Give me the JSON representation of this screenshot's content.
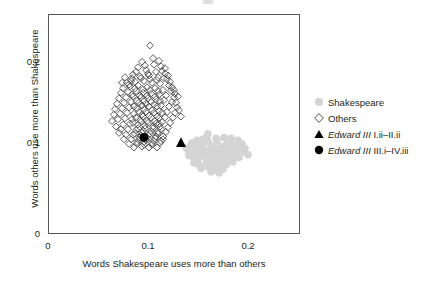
{
  "figure": {
    "background": "#ffffff",
    "frame_color": "#58585a",
    "text_color": "#231f20"
  },
  "axes": {
    "x": {
      "label": "Words Shakespeare uses more than others",
      "ticks": [
        "0",
        "0.1",
        "0.2"
      ],
      "tick_values": [
        0,
        0.1,
        0.2
      ],
      "range": [
        0,
        0.252
      ]
    },
    "y": {
      "label": "Words others use more than Shakespeare",
      "ticks": [
        "0",
        "0.1",
        "0.2"
      ],
      "tick_values": [
        0,
        0.1,
        0.2
      ],
      "range": [
        0,
        0.2415
      ]
    }
  },
  "legend": {
    "position": "right",
    "items": [
      {
        "marker": "circle-filled",
        "color": "#d4d4d4",
        "label": "Shakespeare",
        "italic_prefix": ""
      },
      {
        "marker": "diamond-open",
        "color": "#4d4d4f",
        "label": "Others",
        "italic_prefix": ""
      },
      {
        "marker": "triangle-filled",
        "color": "#000000",
        "label": " I.ii–II.ii",
        "italic_prefix": "Edward III"
      },
      {
        "marker": "circle-filled",
        "color": "#000000",
        "label": " III.i–IV.iii",
        "italic_prefix": "Edward III"
      }
    ]
  },
  "chart_data": {
    "type": "scatter",
    "title": "",
    "xlabel": "Words Shakespeare uses more than others",
    "ylabel": "Words others use more than Shakespeare",
    "xlim": [
      0,
      0.252
    ],
    "ylim": [
      0,
      0.2415
    ],
    "grid": false,
    "legend_position": "right",
    "series": [
      {
        "name": "Shakespeare",
        "marker": "circle-filled",
        "color": "#d4d4d4",
        "size": 7.5,
        "points": [
          [
            0.153,
            0.09
          ],
          [
            0.158,
            0.086
          ],
          [
            0.162,
            0.092
          ],
          [
            0.15,
            0.083
          ],
          [
            0.166,
            0.088
          ],
          [
            0.171,
            0.091
          ],
          [
            0.146,
            0.088
          ],
          [
            0.175,
            0.085
          ],
          [
            0.159,
            0.079
          ],
          [
            0.168,
            0.081
          ],
          [
            0.154,
            0.095
          ],
          [
            0.163,
            0.097
          ],
          [
            0.177,
            0.093
          ],
          [
            0.148,
            0.094
          ],
          [
            0.181,
            0.089
          ],
          [
            0.157,
            0.075
          ],
          [
            0.165,
            0.077
          ],
          [
            0.172,
            0.078
          ],
          [
            0.143,
            0.098
          ],
          [
            0.184,
            0.096
          ],
          [
            0.16,
            0.101
          ],
          [
            0.152,
            0.1
          ],
          [
            0.169,
            0.102
          ],
          [
            0.179,
            0.099
          ],
          [
            0.186,
            0.092
          ],
          [
            0.14,
            0.092
          ],
          [
            0.155,
            0.087
          ],
          [
            0.164,
            0.084
          ],
          [
            0.173,
            0.087
          ],
          [
            0.147,
            0.081
          ],
          [
            0.182,
            0.082
          ],
          [
            0.161,
            0.073
          ],
          [
            0.17,
            0.074
          ],
          [
            0.151,
            0.076
          ],
          [
            0.178,
            0.076
          ],
          [
            0.145,
            0.085
          ],
          [
            0.188,
            0.086
          ],
          [
            0.156,
            0.092
          ],
          [
            0.167,
            0.094
          ],
          [
            0.174,
            0.096
          ],
          [
            0.142,
            0.089
          ],
          [
            0.19,
            0.103
          ],
          [
            0.183,
            0.105
          ],
          [
            0.176,
            0.106
          ],
          [
            0.159,
            0.107
          ],
          [
            0.149,
            0.103
          ],
          [
            0.193,
            0.095
          ],
          [
            0.196,
            0.09
          ],
          [
            0.2,
            0.087
          ],
          [
            0.138,
            0.095
          ],
          [
            0.144,
            0.1
          ],
          [
            0.153,
            0.072
          ],
          [
            0.166,
            0.07
          ],
          [
            0.175,
            0.071
          ],
          [
            0.185,
            0.079
          ],
          [
            0.191,
            0.084
          ],
          [
            0.158,
            0.083
          ],
          [
            0.162,
            0.08
          ],
          [
            0.17,
            0.085
          ],
          [
            0.18,
            0.09
          ],
          [
            0.147,
            0.09
          ],
          [
            0.151,
            0.093
          ],
          [
            0.164,
            0.089
          ],
          [
            0.172,
            0.083
          ],
          [
            0.177,
            0.081
          ],
          [
            0.187,
            0.098
          ],
          [
            0.194,
            0.099
          ],
          [
            0.141,
            0.086
          ],
          [
            0.155,
            0.104
          ],
          [
            0.168,
            0.105
          ],
          [
            0.16,
            0.11
          ],
          [
            0.152,
            0.097
          ],
          [
            0.179,
            0.094
          ],
          [
            0.189,
            0.091
          ],
          [
            0.146,
            0.078
          ],
          [
            0.163,
            0.068
          ],
          [
            0.171,
            0.067
          ],
          [
            0.157,
            0.101
          ],
          [
            0.181,
            0.1
          ],
          [
            0.197,
            0.094
          ]
        ]
      },
      {
        "name": "Others",
        "marker": "diamond-open",
        "color": "#4d4d4f",
        "size": 7,
        "points": [
          [
            0.102,
            0.207
          ],
          [
            0.094,
            0.189
          ],
          [
            0.106,
            0.186
          ],
          [
            0.113,
            0.184
          ],
          [
            0.088,
            0.178
          ],
          [
            0.098,
            0.18
          ],
          [
            0.108,
            0.178
          ],
          [
            0.117,
            0.176
          ],
          [
            0.084,
            0.171
          ],
          [
            0.092,
            0.173
          ],
          [
            0.101,
            0.174
          ],
          [
            0.11,
            0.172
          ],
          [
            0.119,
            0.17
          ],
          [
            0.079,
            0.166
          ],
          [
            0.087,
            0.167
          ],
          [
            0.096,
            0.168
          ],
          [
            0.104,
            0.166
          ],
          [
            0.112,
            0.165
          ],
          [
            0.121,
            0.163
          ],
          [
            0.075,
            0.16
          ],
          [
            0.082,
            0.162
          ],
          [
            0.09,
            0.163
          ],
          [
            0.099,
            0.161
          ],
          [
            0.107,
            0.16
          ],
          [
            0.115,
            0.158
          ],
          [
            0.123,
            0.157
          ],
          [
            0.073,
            0.155
          ],
          [
            0.08,
            0.156
          ],
          [
            0.088,
            0.157
          ],
          [
            0.095,
            0.155
          ],
          [
            0.103,
            0.154
          ],
          [
            0.111,
            0.153
          ],
          [
            0.118,
            0.152
          ],
          [
            0.126,
            0.15
          ],
          [
            0.071,
            0.149
          ],
          [
            0.078,
            0.15
          ],
          [
            0.085,
            0.151
          ],
          [
            0.093,
            0.15
          ],
          [
            0.1,
            0.149
          ],
          [
            0.108,
            0.148
          ],
          [
            0.116,
            0.147
          ],
          [
            0.124,
            0.145
          ],
          [
            0.069,
            0.143
          ],
          [
            0.076,
            0.144
          ],
          [
            0.083,
            0.145
          ],
          [
            0.091,
            0.144
          ],
          [
            0.098,
            0.143
          ],
          [
            0.106,
            0.142
          ],
          [
            0.113,
            0.141
          ],
          [
            0.121,
            0.14
          ],
          [
            0.129,
            0.139
          ],
          [
            0.067,
            0.137
          ],
          [
            0.074,
            0.138
          ],
          [
            0.081,
            0.139
          ],
          [
            0.089,
            0.138
          ],
          [
            0.096,
            0.137
          ],
          [
            0.104,
            0.136
          ],
          [
            0.111,
            0.135
          ],
          [
            0.119,
            0.134
          ],
          [
            0.127,
            0.133
          ],
          [
            0.072,
            0.132
          ],
          [
            0.079,
            0.133
          ],
          [
            0.086,
            0.132
          ],
          [
            0.094,
            0.131
          ],
          [
            0.101,
            0.13
          ],
          [
            0.109,
            0.129
          ],
          [
            0.117,
            0.128
          ],
          [
            0.125,
            0.128
          ],
          [
            0.07,
            0.126
          ],
          [
            0.077,
            0.127
          ],
          [
            0.084,
            0.126
          ],
          [
            0.092,
            0.125
          ],
          [
            0.099,
            0.124
          ],
          [
            0.107,
            0.124
          ],
          [
            0.114,
            0.123
          ],
          [
            0.122,
            0.122
          ],
          [
            0.075,
            0.12
          ],
          [
            0.082,
            0.121
          ],
          [
            0.09,
            0.12
          ],
          [
            0.097,
            0.119
          ],
          [
            0.105,
            0.118
          ],
          [
            0.112,
            0.118
          ],
          [
            0.12,
            0.117
          ],
          [
            0.073,
            0.115
          ],
          [
            0.08,
            0.115
          ],
          [
            0.088,
            0.114
          ],
          [
            0.095,
            0.113
          ],
          [
            0.103,
            0.113
          ],
          [
            0.11,
            0.112
          ],
          [
            0.118,
            0.112
          ],
          [
            0.078,
            0.109
          ],
          [
            0.085,
            0.109
          ],
          [
            0.093,
            0.108
          ],
          [
            0.1,
            0.108
          ],
          [
            0.108,
            0.107
          ],
          [
            0.115,
            0.107
          ],
          [
            0.076,
            0.104
          ],
          [
            0.083,
            0.104
          ],
          [
            0.091,
            0.103
          ],
          [
            0.098,
            0.103
          ],
          [
            0.106,
            0.102
          ],
          [
            0.113,
            0.102
          ],
          [
            0.081,
            0.099
          ],
          [
            0.089,
            0.099
          ],
          [
            0.096,
            0.098
          ],
          [
            0.104,
            0.098
          ],
          [
            0.111,
            0.121
          ],
          [
            0.128,
            0.144
          ],
          [
            0.131,
            0.136
          ],
          [
            0.133,
            0.129
          ],
          [
            0.126,
            0.158
          ],
          [
            0.13,
            0.151
          ],
          [
            0.086,
            0.095
          ],
          [
            0.094,
            0.096
          ],
          [
            0.101,
            0.095
          ],
          [
            0.109,
            0.095
          ],
          [
            0.066,
            0.131
          ],
          [
            0.064,
            0.124
          ],
          [
            0.068,
            0.118
          ],
          [
            0.071,
            0.111
          ],
          [
            0.097,
            0.185
          ],
          [
            0.111,
            0.19
          ],
          [
            0.105,
            0.193
          ],
          [
            0.117,
            0.182
          ],
          [
            0.09,
            0.183
          ],
          [
            0.1,
            0.176
          ],
          [
            0.114,
            0.179
          ],
          [
            0.085,
            0.175
          ],
          [
            0.12,
            0.174
          ],
          [
            0.122,
            0.167
          ],
          [
            0.124,
            0.161
          ],
          [
            0.127,
            0.154
          ],
          [
            0.083,
            0.168
          ],
          [
            0.077,
            0.172
          ],
          [
            0.081,
            0.164
          ],
          [
            0.074,
            0.166
          ],
          [
            0.093,
            0.171
          ],
          [
            0.102,
            0.17
          ],
          [
            0.109,
            0.169
          ],
          [
            0.116,
            0.171
          ],
          [
            0.087,
            0.16
          ],
          [
            0.095,
            0.159
          ],
          [
            0.102,
            0.158
          ],
          [
            0.11,
            0.157
          ],
          [
            0.084,
            0.153
          ],
          [
            0.092,
            0.152
          ],
          [
            0.099,
            0.152
          ],
          [
            0.107,
            0.151
          ],
          [
            0.089,
            0.146
          ],
          [
            0.096,
            0.146
          ],
          [
            0.103,
            0.145
          ],
          [
            0.112,
            0.146
          ],
          [
            0.086,
            0.14
          ],
          [
            0.094,
            0.141
          ],
          [
            0.101,
            0.14
          ],
          [
            0.109,
            0.14
          ],
          [
            0.091,
            0.134
          ],
          [
            0.098,
            0.134
          ],
          [
            0.106,
            0.133
          ],
          [
            0.114,
            0.133
          ],
          [
            0.088,
            0.128
          ],
          [
            0.095,
            0.129
          ],
          [
            0.103,
            0.128
          ],
          [
            0.111,
            0.127
          ],
          [
            0.085,
            0.122
          ],
          [
            0.093,
            0.123
          ],
          [
            0.1,
            0.122
          ],
          [
            0.108,
            0.121
          ],
          [
            0.09,
            0.116
          ],
          [
            0.097,
            0.116
          ],
          [
            0.105,
            0.116
          ],
          [
            0.113,
            0.115
          ],
          [
            0.087,
            0.11
          ],
          [
            0.094,
            0.111
          ],
          [
            0.102,
            0.11
          ],
          [
            0.11,
            0.11
          ],
          [
            0.092,
            0.106
          ],
          [
            0.099,
            0.105
          ],
          [
            0.107,
            0.105
          ],
          [
            0.115,
            0.104
          ],
          [
            0.089,
            0.101
          ],
          [
            0.096,
            0.101
          ],
          [
            0.104,
            0.1
          ],
          [
            0.112,
            0.1
          ]
        ]
      },
      {
        "name": "Edward III I.ii-II.ii",
        "marker": "triangle-filled",
        "color": "#000000",
        "size": 9,
        "points": [
          [
            0.133,
            0.1
          ]
        ]
      },
      {
        "name": "Edward III III.i-IV.iii",
        "marker": "circle-filled",
        "color": "#000000",
        "size": 9,
        "points": [
          [
            0.096,
            0.106
          ]
        ]
      }
    ]
  }
}
